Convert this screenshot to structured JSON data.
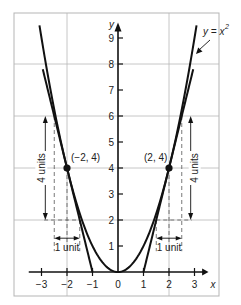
{
  "chart_data": {
    "type": "line",
    "title": "",
    "xlabel": "x",
    "ylabel": "y",
    "xlim": [
      -3.5,
      3.5
    ],
    "ylim": [
      0,
      10
    ],
    "grid": true,
    "grid_lines": {
      "x": [
        -2,
        2
      ],
      "y": [
        2,
        4,
        6,
        8
      ]
    },
    "x_ticks": [
      -3,
      -2,
      -1,
      0,
      1,
      2,
      3
    ],
    "x_tick_labels": [
      "−3",
      "−2",
      "−1",
      "0",
      "1",
      "2",
      "3"
    ],
    "y_ticks": [
      1,
      2,
      3,
      4,
      5,
      6,
      7,
      8,
      9
    ],
    "y_tick_labels": [
      "1",
      "2",
      "3",
      "4",
      "5",
      "6",
      "7",
      "8",
      "9"
    ],
    "series": [
      {
        "name": "y = x^2",
        "label": "y = x",
        "label_superscript": "2",
        "kind": "curve",
        "function": "x^2",
        "x_range": [
          -3.08,
          3.08
        ]
      },
      {
        "name": "tangent at (-2,4)",
        "kind": "line",
        "slope": -4,
        "intercept": -4,
        "x_range": [
          -2.95,
          -1.0
        ]
      },
      {
        "name": "tangent at (2,4)",
        "kind": "line",
        "slope": 4,
        "intercept": -4,
        "x_range": [
          1.0,
          2.95
        ]
      }
    ],
    "points": [
      {
        "x": -2,
        "y": 4,
        "label": "(−2, 4)"
      },
      {
        "x": 2,
        "y": 4,
        "label": "(2, 4)"
      }
    ],
    "annotations": [
      {
        "text": "4 units",
        "side": "left",
        "from_y": 2,
        "to_y": 6,
        "x": -2.85,
        "orientation": "vertical"
      },
      {
        "text": "4 units",
        "side": "right",
        "from_y": 2,
        "to_y": 6,
        "x": 2.85,
        "orientation": "vertical"
      },
      {
        "text": "1 unit",
        "side": "left",
        "from_x": -2.5,
        "to_x": -1.5,
        "y": 1.3,
        "orientation": "horizontal"
      },
      {
        "text": "1 unit",
        "side": "right",
        "from_x": 1.5,
        "to_x": 2.5,
        "y": 1.3,
        "orientation": "horizontal"
      }
    ]
  }
}
